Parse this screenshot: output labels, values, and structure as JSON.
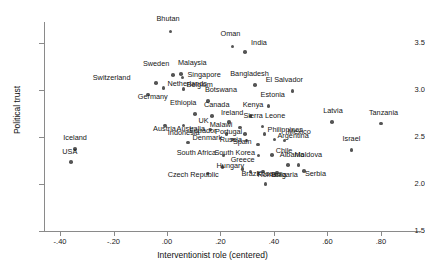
{
  "chart_data": {
    "type": "scatter",
    "title": "",
    "xlabel": "Interventionist role (centered)",
    "ylabel": "Political trust",
    "xlim": [
      -0.46,
      0.95
    ],
    "ylim": [
      1.5,
      3.72
    ],
    "xticks": [
      -0.4,
      -0.2,
      0.0,
      0.2,
      0.4,
      0.6,
      0.8
    ],
    "xticklabels": [
      "-.40",
      "-.20",
      ".00",
      ".20",
      ".40",
      ".60",
      ".80"
    ],
    "yticks": [
      1.5,
      2.0,
      2.5,
      3.0,
      3.5
    ],
    "yticklabels": [
      "1.5",
      "2.0",
      "2.5",
      "3.0",
      "3.5"
    ],
    "grid": false,
    "legend": null,
    "marker_color": "#555555",
    "axis_color": "#8a8a8a",
    "points": [
      {
        "label": "Bhutan",
        "x": 0.013,
        "y": 3.62,
        "lx": -14,
        "ly": -12
      },
      {
        "label": "Oman",
        "x": 0.245,
        "y": 3.46,
        "lx": -12,
        "ly": -12
      },
      {
        "label": "India",
        "x": 0.292,
        "y": 3.4,
        "lx": 6,
        "ly": -9
      },
      {
        "label": "Sweden",
        "x": 0.022,
        "y": 3.16,
        "lx": -30,
        "ly": -11
      },
      {
        "label": "Malaysia",
        "x": 0.052,
        "y": 3.17,
        "lx": -3,
        "ly": -11
      },
      {
        "label": "Singapore",
        "x": 0.058,
        "y": 3.13,
        "lx": 5,
        "ly": -3
      },
      {
        "label": "Switzerland",
        "x": -0.042,
        "y": 3.07,
        "lx": -63,
        "ly": -5
      },
      {
        "label": "Bangladesh",
        "x": 0.33,
        "y": 3.05,
        "lx": -25,
        "ly": -11
      },
      {
        "label": "Netherlands",
        "x": -0.013,
        "y": 3.02,
        "lx": 4,
        "ly": -4
      },
      {
        "label": "Belgium",
        "x": 0.062,
        "y": 3.01,
        "lx": 3,
        "ly": -4
      },
      {
        "label": "El Salvador",
        "x": 0.47,
        "y": 2.99,
        "lx": -27,
        "ly": -11
      },
      {
        "label": "Germany",
        "x": -0.072,
        "y": 2.95,
        "lx": -10,
        "ly": 3
      },
      {
        "label": "Botswana",
        "x": 0.153,
        "y": 2.88,
        "lx": -3,
        "ly": -11
      },
      {
        "label": "Estonia",
        "x": 0.38,
        "y": 2.83,
        "lx": -8,
        "ly": -11
      },
      {
        "label": "Ethiopia",
        "x": 0.105,
        "y": 2.74,
        "lx": -25,
        "ly": -11
      },
      {
        "label": "Canada",
        "x": 0.168,
        "y": 2.72,
        "lx": -8,
        "ly": -11
      },
      {
        "label": "Kenya",
        "x": 0.313,
        "y": 2.72,
        "lx": -8,
        "ly": -11
      },
      {
        "label": "Ireland",
        "x": 0.232,
        "y": 2.66,
        "lx": -8,
        "ly": -9
      },
      {
        "label": "Latvia",
        "x": 0.618,
        "y": 2.66,
        "lx": -9,
        "ly": -11
      },
      {
        "label": "Tanzania",
        "x": 0.8,
        "y": 2.64,
        "lx": -12,
        "ly": -11
      },
      {
        "label": "Sierra Leone",
        "x": 0.357,
        "y": 2.61,
        "lx": -19,
        "ly": -11
      },
      {
        "label": "Austria",
        "x": -0.007,
        "y": 2.62,
        "lx": -12,
        "ly": 3
      },
      {
        "label": "Australia",
        "x": 0.062,
        "y": 2.62,
        "lx": -7,
        "ly": 3
      },
      {
        "label": "UK",
        "x": 0.163,
        "y": 2.58,
        "lx": -12,
        "ly": -8
      },
      {
        "label": "Malawi",
        "x": 0.272,
        "y": 2.6,
        "lx": -30,
        "ly": -2
      },
      {
        "label": "Ecuador",
        "x": 0.222,
        "y": 2.53,
        "lx": -37,
        "ly": -3
      },
      {
        "label": "Portugal",
        "x": 0.292,
        "y": 2.53,
        "lx": -30,
        "ly": -2
      },
      {
        "label": "Philippines",
        "x": 0.365,
        "y": 2.53,
        "lx": 3,
        "ly": -4
      },
      {
        "label": "Indonesia",
        "x": 0.078,
        "y": 2.44,
        "lx": -20,
        "ly": -10
      },
      {
        "label": "Denmark",
        "x": 0.245,
        "y": 2.47,
        "lx": -40,
        "ly": -2
      },
      {
        "label": "Russia",
        "x": 0.298,
        "y": 2.46,
        "lx": -27,
        "ly": -1
      },
      {
        "label": "Argentina",
        "x": 0.402,
        "y": 2.47,
        "lx": 3,
        "ly": -4
      },
      {
        "label": "Mexico",
        "x": 0.44,
        "y": 2.46,
        "lx": 3,
        "ly": -9
      },
      {
        "label": "Spain",
        "x": 0.34,
        "y": 2.42,
        "lx": -25,
        "ly": -2
      },
      {
        "label": "Israel",
        "x": 0.69,
        "y": 2.36,
        "lx": -9,
        "ly": -11
      },
      {
        "label": "South Africa",
        "x": 0.212,
        "y": 2.3,
        "lx": -47,
        "ly": -3
      },
      {
        "label": "South Korea",
        "x": 0.342,
        "y": 2.3,
        "lx": -44,
        "ly": -3
      },
      {
        "label": "Chile",
        "x": 0.392,
        "y": 2.31,
        "lx": 4,
        "ly": -4
      },
      {
        "label": "Iceland",
        "x": -0.343,
        "y": 2.37,
        "lx": -12,
        "ly": -11
      },
      {
        "label": "USA",
        "x": -0.358,
        "y": 2.23,
        "lx": -9,
        "ly": -10
      },
      {
        "label": "Hungary",
        "x": 0.208,
        "y": 2.18,
        "lx": -6,
        "ly": -1
      },
      {
        "label": "Albania",
        "x": 0.452,
        "y": 2.2,
        "lx": -8,
        "ly": -10
      },
      {
        "label": "Moldova",
        "x": 0.492,
        "y": 2.2,
        "lx": -4,
        "ly": -10
      },
      {
        "label": "Greece",
        "x": 0.283,
        "y": 2.16,
        "lx": -12,
        "ly": -9
      },
      {
        "label": "Czech Republic",
        "x": 0.152,
        "y": 2.11,
        "lx": -40,
        "ly": 1
      },
      {
        "label": "Brazil",
        "x": 0.312,
        "y": 2.13,
        "lx": -9,
        "ly": 2
      },
      {
        "label": "Kosovo",
        "x": 0.358,
        "y": 2.13,
        "lx": -6,
        "ly": 2
      },
      {
        "label": "Bulgaria",
        "x": 0.412,
        "y": 2.12,
        "lx": -6,
        "ly": 2
      },
      {
        "label": "Serbia",
        "x": 0.512,
        "y": 2.14,
        "lx": 1,
        "ly": 3
      },
      {
        "label": "Romania",
        "x": 0.368,
        "y": 2.0,
        "lx": -8,
        "ly": -9
      }
    ]
  }
}
